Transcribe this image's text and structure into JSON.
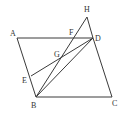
{
  "diagram": {
    "type": "geometry",
    "colors": {
      "stroke": "#3a3a3a",
      "label": "#333333",
      "background": "#ffffff"
    },
    "points": [
      {
        "name": "A",
        "x": 17,
        "y": 38,
        "label": "A",
        "lx": 10,
        "ly": 36
      },
      {
        "name": "D",
        "x": 93,
        "y": 38,
        "label": "D",
        "lx": 95,
        "ly": 41
      },
      {
        "name": "B",
        "x": 36,
        "y": 97,
        "label": "B",
        "lx": 31,
        "ly": 108
      },
      {
        "name": "C",
        "x": 112,
        "y": 97,
        "label": "C",
        "lx": 112,
        "ly": 106
      },
      {
        "name": "H",
        "x": 87,
        "y": 17,
        "label": "H",
        "lx": 84,
        "ly": 12
      },
      {
        "name": "F",
        "x": 74,
        "y": 38,
        "label": "F",
        "lx": 69,
        "ly": 35
      },
      {
        "name": "G",
        "x": 61,
        "y": 59,
        "label": "G",
        "lx": 54,
        "ly": 57
      },
      {
        "name": "E",
        "x": 31,
        "y": 76,
        "label": "E",
        "lx": 22,
        "ly": 83
      }
    ],
    "segments": [
      [
        "A",
        "D"
      ],
      [
        "A",
        "B"
      ],
      [
        "B",
        "C"
      ],
      [
        "D",
        "C"
      ],
      [
        "B",
        "D"
      ],
      [
        "B",
        "H"
      ],
      [
        "H",
        "D"
      ],
      [
        "E",
        "D"
      ]
    ]
  }
}
